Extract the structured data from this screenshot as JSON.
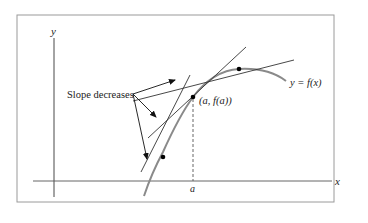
{
  "figure": {
    "labels": {
      "y_axis": "y",
      "x_axis": "x",
      "slope_note": "Slope decreases",
      "point_label": "(a, f(a))",
      "curve_label": "y = f(x)",
      "a_tick": "a"
    },
    "colors": {
      "frame": "#9a9a9a",
      "axis": "#333333",
      "curve": "#8a8a8a",
      "tangent": "#333333",
      "arrow": "#111111",
      "point": "#000000",
      "dashed": "#555555"
    },
    "points": [
      {
        "name": "lower-tangent-point",
        "x": 163,
        "y": 157
      },
      {
        "name": "point-a",
        "x": 193,
        "y": 97
      },
      {
        "name": "upper-tangent-point",
        "x": 239,
        "y": 69
      }
    ]
  }
}
